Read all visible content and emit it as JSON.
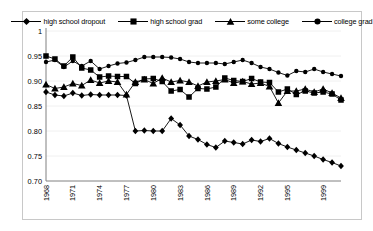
{
  "chart_data": {
    "type": "line",
    "title": "",
    "xlabel": "",
    "ylabel": "",
    "ylim": [
      0.7,
      1.0
    ],
    "ytick_labels": [
      "1",
      "0.95",
      "0.90",
      "0.85",
      "0.80",
      "0.75",
      "0.70"
    ],
    "ytick_values": [
      1.0,
      0.95,
      0.9,
      0.85,
      0.8,
      0.75,
      0.7
    ],
    "grid": true,
    "legend_position": "top",
    "x_start": 1968,
    "x_end": 2001,
    "x": [
      1968,
      1969,
      1970,
      1971,
      1972,
      1973,
      1974,
      1975,
      1976,
      1977,
      1978,
      1979,
      1980,
      1981,
      1982,
      1983,
      1984,
      1985,
      1986,
      1987,
      1988,
      1989,
      1990,
      1991,
      1992,
      1993,
      1994,
      1995,
      1996,
      1997,
      1998,
      1999,
      2000,
      2001
    ],
    "xtick_labels": [
      "1968",
      "1971",
      "1974",
      "1977",
      "1980",
      "1983",
      "1986",
      "1989",
      "1992",
      "1995",
      "1999"
    ],
    "xtick_values": [
      1968,
      1971,
      1974,
      1977,
      1980,
      1983,
      1986,
      1989,
      1992,
      1995,
      1999
    ],
    "series": [
      {
        "name": "high school dropout",
        "marker": "diamond",
        "values": [
          0.878,
          0.872,
          0.87,
          0.876,
          0.871,
          0.873,
          0.872,
          0.872,
          0.872,
          0.871,
          0.8,
          0.801,
          0.8,
          0.8,
          0.825,
          0.812,
          0.79,
          0.783,
          0.773,
          0.767,
          0.78,
          0.777,
          0.774,
          0.782,
          0.779,
          0.785,
          0.775,
          0.768,
          0.762,
          0.756,
          0.75,
          0.743,
          0.737,
          0.73
        ]
      },
      {
        "name": "high school grad",
        "marker": "square",
        "values": [
          0.95,
          0.944,
          0.93,
          0.948,
          0.926,
          0.922,
          0.908,
          0.91,
          0.909,
          0.909,
          0.895,
          0.904,
          0.905,
          0.899,
          0.88,
          0.883,
          0.868,
          0.885,
          0.884,
          0.888,
          0.906,
          0.901,
          0.899,
          0.905,
          0.898,
          0.897,
          0.878,
          0.884,
          0.873,
          0.88,
          0.876,
          0.878,
          0.874,
          0.862
        ]
      },
      {
        "name": "some college",
        "marker": "triangle",
        "values": [
          0.893,
          0.885,
          0.888,
          0.895,
          0.891,
          0.902,
          0.896,
          0.9,
          0.898,
          0.873,
          0.898,
          0.903,
          0.895,
          0.906,
          0.898,
          0.901,
          0.898,
          0.89,
          0.898,
          0.9,
          0.903,
          0.896,
          0.899,
          0.894,
          0.896,
          0.889,
          0.856,
          0.88,
          0.88,
          0.884,
          0.878,
          0.884,
          0.876,
          0.866
        ]
      },
      {
        "name": "college grad",
        "marker": "circle",
        "values": [
          0.938,
          0.942,
          0.928,
          0.94,
          0.93,
          0.94,
          0.924,
          0.93,
          0.935,
          0.937,
          0.942,
          0.948,
          0.948,
          0.948,
          0.947,
          0.944,
          0.938,
          0.936,
          0.936,
          0.936,
          0.934,
          0.938,
          0.942,
          0.936,
          0.928,
          0.924,
          0.917,
          0.911,
          0.92,
          0.918,
          0.924,
          0.918,
          0.914,
          0.91
        ]
      }
    ]
  },
  "legend": {
    "items": [
      {
        "label": "high school dropout",
        "marker": "diamond"
      },
      {
        "label": "high school grad",
        "marker": "square"
      },
      {
        "label": "some college",
        "marker": "triangle"
      },
      {
        "label": "college grad",
        "marker": "circle"
      }
    ]
  },
  "colors": {
    "line": "#000000",
    "marker": "#000000",
    "axis": "#808080",
    "grid": "#f0f0f0",
    "frame": "#c8c8c8",
    "background": "#ffffff"
  }
}
